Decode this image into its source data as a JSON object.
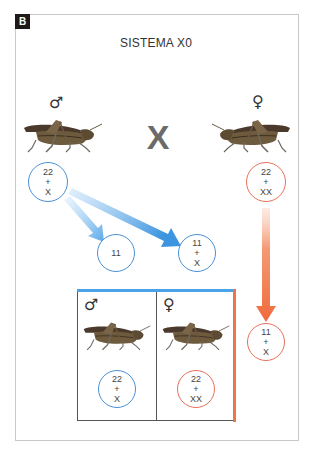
{
  "figure": {
    "panel_label": "B",
    "title": "SISTEMA X0",
    "cross_symbol": "X",
    "colors": {
      "male": "#4a90d6",
      "female": "#e8705a",
      "male_arrow": "#3d95e0",
      "female_arrow": "#f06a3a"
    }
  },
  "parents": {
    "male": {
      "symbol": "♂",
      "icon": "grasshopper-icon",
      "karyotype": [
        "22",
        "+",
        "X"
      ]
    },
    "female": {
      "symbol": "♀",
      "icon": "grasshopper-icon",
      "karyotype": [
        "22",
        "+",
        "XX"
      ]
    }
  },
  "gametes": {
    "male": [
      {
        "karyotype": [
          "11"
        ]
      },
      {
        "karyotype": [
          "11",
          "+",
          "X"
        ]
      }
    ],
    "female": [
      {
        "karyotype": [
          "11",
          "+",
          "X"
        ]
      }
    ]
  },
  "offspring": {
    "male": {
      "symbol": "♂",
      "icon": "grasshopper-icon",
      "karyotype": [
        "22",
        "+",
        "X"
      ]
    },
    "female": {
      "symbol": "♀",
      "icon": "grasshopper-icon",
      "karyotype": [
        "22",
        "+",
        "XX"
      ]
    }
  }
}
